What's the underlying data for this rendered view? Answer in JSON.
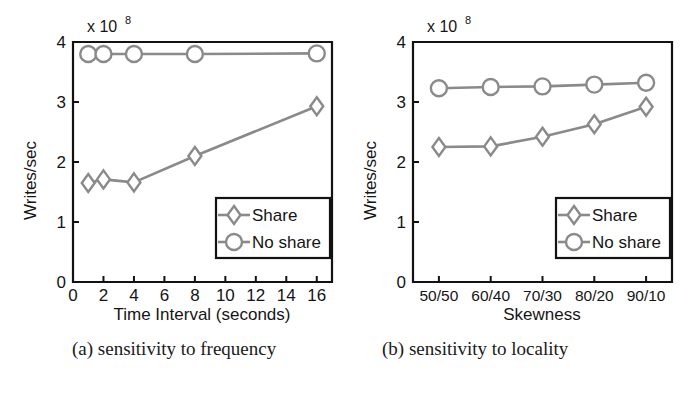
{
  "figure": {
    "captions": [
      {
        "id": "a",
        "text": "(a) sensitivity to frequency"
      },
      {
        "id": "b",
        "text": "(b) sensitivity to locality"
      }
    ],
    "colors": {
      "series_gray": "#8a8a8a",
      "axis_black": "#121212",
      "background": "#ffffff"
    }
  },
  "chart_data": [
    {
      "type": "line",
      "panel": "a",
      "title": "(a) sensitivity to frequency",
      "xlabel": "Time Interval (seconds)",
      "ylabel": "Writes/sec",
      "y_exponent_label": "x 10",
      "y_exponent_power": "8",
      "x": [
        1,
        2,
        4,
        8,
        16
      ],
      "xticks": [
        0,
        2,
        4,
        6,
        8,
        10,
        12,
        14,
        16
      ],
      "xticklabels": [
        "0",
        "2",
        "4",
        "6",
        "8",
        "10",
        "12",
        "14",
        "16"
      ],
      "yticks": [
        0,
        1,
        2,
        3,
        4
      ],
      "yticklabels": [
        "0",
        "1",
        "2",
        "3",
        "4"
      ],
      "xlim": [
        0,
        17
      ],
      "ylim": [
        0,
        4
      ],
      "grid": false,
      "legend_position": "lower right",
      "series": [
        {
          "name": "Share",
          "marker": "diamond",
          "values": [
            1.65,
            1.71,
            1.66,
            2.1,
            2.93
          ]
        },
        {
          "name": "No share",
          "marker": "circle",
          "values": [
            3.8,
            3.8,
            3.8,
            3.8,
            3.81
          ]
        }
      ]
    },
    {
      "type": "line",
      "panel": "b",
      "title": "(b) sensitivity to locality",
      "xlabel": "Skewness",
      "ylabel": "Writes/sec",
      "y_exponent_label": "x 10",
      "y_exponent_power": "8",
      "categories": [
        "50/50",
        "60/40",
        "70/30",
        "80/20",
        "90/10"
      ],
      "yticks": [
        0,
        1,
        2,
        3,
        4
      ],
      "yticklabels": [
        "0",
        "1",
        "2",
        "3",
        "4"
      ],
      "ylim": [
        0,
        4
      ],
      "grid": false,
      "legend_position": "lower right",
      "series": [
        {
          "name": "Share",
          "marker": "diamond",
          "values": [
            2.25,
            2.26,
            2.42,
            2.63,
            2.92
          ]
        },
        {
          "name": "No share",
          "marker": "circle",
          "values": [
            3.23,
            3.25,
            3.26,
            3.29,
            3.32
          ]
        }
      ]
    }
  ]
}
